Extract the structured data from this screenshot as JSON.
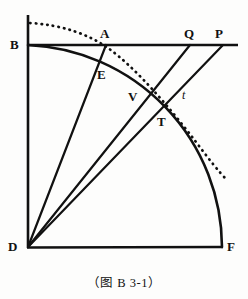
{
  "figure": {
    "caption": "（图 B 3-1）",
    "stroke_color": "#111111",
    "background_color": "#fdfdfc",
    "labels": [
      {
        "id": "B",
        "text": "B",
        "x": 10,
        "y": 38,
        "italic": false
      },
      {
        "id": "A",
        "text": "A",
        "x": 100,
        "y": 27,
        "italic": false
      },
      {
        "id": "Q",
        "text": "Q",
        "x": 184,
        "y": 27,
        "italic": false
      },
      {
        "id": "P",
        "text": "P",
        "x": 215,
        "y": 27,
        "italic": false
      },
      {
        "id": "E",
        "text": "E",
        "x": 97,
        "y": 68,
        "italic": false
      },
      {
        "id": "V",
        "text": "V",
        "x": 128,
        "y": 90,
        "italic": false
      },
      {
        "id": "t",
        "text": "t",
        "x": 182,
        "y": 89,
        "italic": true
      },
      {
        "id": "T",
        "text": "T",
        "x": 157,
        "y": 115,
        "italic": false
      },
      {
        "id": "D",
        "text": "D",
        "x": 8,
        "y": 240,
        "italic": false
      },
      {
        "id": "F",
        "text": "F",
        "x": 227,
        "y": 240,
        "italic": false
      }
    ],
    "points": {
      "D": {
        "x": 28,
        "y": 248
      },
      "F": {
        "x": 222,
        "y": 247
      },
      "B": {
        "x": 28,
        "y": 45
      },
      "A": {
        "x": 105,
        "y": 45
      },
      "Q": {
        "x": 189,
        "y": 45
      },
      "P": {
        "x": 222,
        "y": 45
      },
      "E": {
        "x": 104,
        "y": 64
      },
      "V": {
        "x": 142,
        "y": 95
      },
      "T": {
        "x": 152,
        "y": 110
      },
      "vertical_top": {
        "x": 28,
        "y": 15
      },
      "horizontal_right": {
        "x": 238,
        "y": 45
      },
      "dotted_start": {
        "x": 30,
        "y": 23
      },
      "dotted_end": {
        "x": 227,
        "y": 180
      }
    },
    "arc": {
      "center_x": 28,
      "center_y": 248,
      "radius": 203,
      "from": "B",
      "to": "F"
    },
    "elements": [
      {
        "name": "vertical-axis-line",
        "kind": "line",
        "desc": "D up through B to top"
      },
      {
        "name": "horizontal-axis-line",
        "kind": "line",
        "desc": "B through A, Q, P to right edge"
      },
      {
        "name": "base-line-df",
        "kind": "line",
        "desc": "D to F"
      },
      {
        "name": "quarter-arc-bf",
        "kind": "arc",
        "desc": "arc centered at D from B through E, V to F"
      },
      {
        "name": "ray-d-a",
        "kind": "line",
        "desc": "ray from D through E to A"
      },
      {
        "name": "ray-d-q",
        "kind": "line",
        "desc": "ray from D through T to Q"
      },
      {
        "name": "ray-d-p",
        "kind": "line",
        "desc": "ray from D through t to P"
      },
      {
        "name": "dotted-curve",
        "kind": "curve",
        "desc": "dotted curve from upper-left, through A, past t, to lower-right"
      }
    ]
  }
}
